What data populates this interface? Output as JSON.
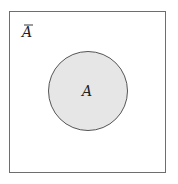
{
  "diagram": {
    "type": "venn",
    "universe_label": "Ā",
    "universe_label_base": "A",
    "set_label": "A",
    "colors": {
      "border": "#6e6e6e",
      "circle_fill": "#e6e6e6",
      "circle_stroke": "#555555",
      "background": "#ffffff"
    }
  }
}
